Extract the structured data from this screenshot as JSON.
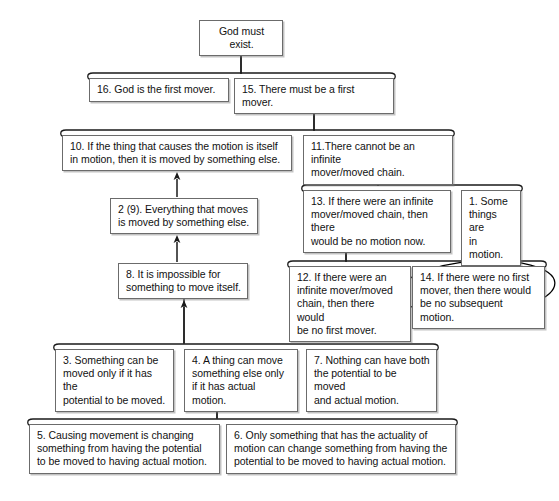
{
  "diagram": {
    "background_color": "#ffffff",
    "box_border_color": "#6b6b6b",
    "line_color": "#1a1a1a",
    "annotation_color": "#000000",
    "nodes": [
      {
        "id": "n17",
        "label": "God must exist.",
        "x": 199,
        "y": 20,
        "w": 84,
        "h": 24,
        "align": "center"
      },
      {
        "id": "n16",
        "label": "16. God is the first mover.",
        "x": 89,
        "y": 78,
        "w": 140,
        "h": 24,
        "align": "left"
      },
      {
        "id": "n15",
        "label": "15. There must be a first mover.",
        "x": 234,
        "y": 78,
        "w": 160,
        "h": 24,
        "align": "left"
      },
      {
        "id": "n10",
        "label": "10. If the thing that causes the motion is itself\nin motion, then it is moved by something else.",
        "x": 62,
        "y": 135,
        "w": 230,
        "h": 36,
        "align": "left"
      },
      {
        "id": "n11",
        "label": "11.There cannot be an infinite\nmover/moved chain.",
        "x": 303,
        "y": 135,
        "w": 150,
        "h": 36,
        "align": "left"
      },
      {
        "id": "n2",
        "label": "2 (9). Everything that moves\nis moved by something else.",
        "x": 110,
        "y": 198,
        "w": 148,
        "h": 36,
        "align": "left"
      },
      {
        "id": "n13",
        "label": "13. If there were an infinite\nmover/moved chain, then there\nwould be no motion now.",
        "x": 303,
        "y": 190,
        "w": 148,
        "h": 48,
        "align": "left"
      },
      {
        "id": "n1",
        "label": "1. Some\nthings are\nin motion.",
        "x": 461,
        "y": 190,
        "w": 60,
        "h": 48,
        "align": "left"
      },
      {
        "id": "n8",
        "label": "8. It is impossible for\nsomething to move itself.",
        "x": 118,
        "y": 263,
        "w": 130,
        "h": 36,
        "align": "left"
      },
      {
        "id": "n12",
        "label": "12. If there were an\ninfinite mover/moved\nchain, then there would\nbe no first mover.",
        "x": 289,
        "y": 266,
        "w": 122,
        "h": 60,
        "align": "left"
      },
      {
        "id": "n14",
        "label": "14. If there were no first\nmover, then there would\nbe no subsequent motion.",
        "x": 412,
        "y": 266,
        "w": 133,
        "h": 48,
        "align": "left"
      },
      {
        "id": "n3",
        "label": "3. Something can be\nmoved only if it has the\npotential to be moved.",
        "x": 55,
        "y": 349,
        "w": 119,
        "h": 48,
        "align": "left"
      },
      {
        "id": "n4",
        "label": "4. A thing can move\nsomething else only\nif it has actual motion.",
        "x": 184,
        "y": 349,
        "w": 114,
        "h": 48,
        "align": "left"
      },
      {
        "id": "n7",
        "label": "7. Nothing can have both\nthe potential to be moved\nand actual motion.",
        "x": 306,
        "y": 349,
        "w": 131,
        "h": 48,
        "align": "left"
      },
      {
        "id": "n5",
        "label": "5. Causing movement is changing\nsomething from having the potential\nto be moved to having actual motion.",
        "x": 29,
        "y": 424,
        "w": 191,
        "h": 48,
        "align": "left"
      },
      {
        "id": "n6",
        "label": "6. Only something that has the actuality of\nmotion can change something from having the\npotential to be moved to having actual motion.",
        "x": 226,
        "y": 424,
        "w": 230,
        "h": 48,
        "align": "left"
      }
    ],
    "brackets": [
      {
        "id": "b-16-15",
        "name": "linked-premise-bracket-16-15",
        "x1": 86,
        "x2": 397,
        "y": 73,
        "stem_x": 241,
        "stem_top": 44
      },
      {
        "id": "b-10-11",
        "name": "linked-premise-bracket-10-11",
        "x1": 59,
        "x2": 456,
        "y": 130,
        "stem_x": 314,
        "stem_top": 102
      },
      {
        "id": "b-13-1",
        "name": "linked-premise-bracket-13-1",
        "x1": 300,
        "x2": 524,
        "y": 185,
        "stem_x": 378,
        "stem_top": 171
      },
      {
        "id": "b-12-14",
        "name": "linked-premise-bracket-12-14",
        "x1": 286,
        "x2": 548,
        "y": 261,
        "stem_x": 346,
        "stem_top": 238
      },
      {
        "id": "b-3-4-7",
        "name": "linked-premise-bracket-3-4-7",
        "x1": 52,
        "x2": 440,
        "y": 344,
        "stem_x": 184,
        "stem_top": 299
      },
      {
        "id": "b-5-6",
        "name": "linked-premise-bracket-5-6",
        "x1": 26,
        "x2": 459,
        "y": 419,
        "stem_x": 217,
        "stem_top": 397
      }
    ],
    "arrows": [
      {
        "id": "a-15-to-17",
        "name": "arrow-to-god-must-exist",
        "x": 241,
        "y1": 74,
        "y2": 46,
        "note": "from bracket 16+15 up to God must exist"
      },
      {
        "id": "a-11-to-15",
        "name": "arrow-to-15",
        "x": 314,
        "y1": 131,
        "y2": 103,
        "note": "from bracket 10+11 up to 15"
      },
      {
        "id": "a-2-to-10",
        "name": "arrow-to-10",
        "x": 177,
        "y1": 197,
        "y2": 172,
        "note": "from 2(9) up to 10"
      },
      {
        "id": "a-13-to-11",
        "name": "arrow-to-11",
        "x": 378,
        "y1": 186,
        "y2": 172,
        "note": "from bracket 13+1 up to 11"
      },
      {
        "id": "a-8-to-2",
        "name": "arrow-to-2",
        "x": 177,
        "y1": 262,
        "y2": 235,
        "note": "from 8 up to 2(9)"
      },
      {
        "id": "a-12-to-13",
        "name": "arrow-to-13",
        "x": 346,
        "y1": 262,
        "y2": 239,
        "note": "from bracket 12+14 up to 13"
      },
      {
        "id": "a-3-to-8",
        "name": "arrow-to-8",
        "x": 184,
        "y1": 343,
        "y2": 300,
        "note": "from bracket 3+4+7 up to 8"
      },
      {
        "id": "a-5-to-4",
        "name": "arrow-to-4",
        "x": 217,
        "y1": 418,
        "y2": 398,
        "note": "from bracket 5+6 up to 4"
      }
    ],
    "annotations": [
      {
        "id": "ellipse-14",
        "name": "handdrawn-ellipse-around-14",
        "shape": "ellipse",
        "cx": 477,
        "cy": 288,
        "rx": 78,
        "ry": 27,
        "rotation": -4
      }
    ]
  }
}
